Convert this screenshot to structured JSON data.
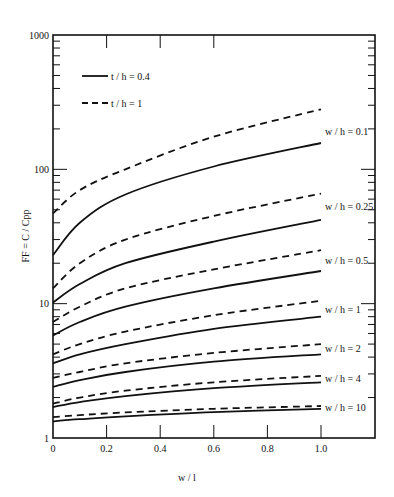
{
  "chart_data": {
    "type": "line",
    "title": "",
    "xlabel": "w / l",
    "ylabel": "FF = C / Cpp",
    "xlim": [
      0,
      1.2
    ],
    "ylim": [
      1,
      1000
    ],
    "yscale": "log",
    "grid": false,
    "x_ticks": [
      0,
      0.2,
      0.4,
      0.6,
      0.8,
      1.0
    ],
    "x_tick_labels": [
      "0",
      "0.2",
      "0.4",
      "0.6",
      "0.8",
      "1.0"
    ],
    "y_ticks": [
      1,
      10,
      100,
      1000
    ],
    "y_tick_labels": [
      "1",
      "10",
      "100",
      "1000"
    ],
    "legend": {
      "position": "upper-left",
      "entries": [
        {
          "label": "t / h = 0.4",
          "style": "solid"
        },
        {
          "label": "t / h = 1",
          "style": "dashed"
        }
      ]
    },
    "x": [
      0,
      0.1,
      0.27,
      0.6,
      1.0
    ],
    "series": [
      {
        "name": "w/h=0.1, t/h=0.4",
        "group": "w / h = 0.1",
        "style": "solid",
        "values": [
          23,
          40,
          65,
          105,
          157
        ]
      },
      {
        "name": "w/h=0.1, t/h=1",
        "group": "w / h = 0.1",
        "style": "dashed",
        "values": [
          47,
          70,
          100,
          175,
          280
        ]
      },
      {
        "name": "w/h=0.25, t/h=0.4",
        "group": "w / h = 0.25",
        "style": "solid",
        "values": [
          10.2,
          14,
          20,
          29,
          42
        ]
      },
      {
        "name": "w/h=0.25, t/h=1",
        "group": "w / h = 0.25",
        "style": "dashed",
        "values": [
          13,
          20,
          30,
          45,
          66
        ]
      },
      {
        "name": "w/h=0.5, t/h=0.4",
        "group": "w / h = 0.5",
        "style": "solid",
        "values": [
          5.8,
          7.3,
          9.5,
          13,
          17.5
        ]
      },
      {
        "name": "w/h=0.5, t/h=1",
        "group": "w / h = 0.5",
        "style": "dashed",
        "values": [
          7.3,
          9.5,
          13,
          18,
          25
        ]
      },
      {
        "name": "w/h=1, t/h=0.4",
        "group": "w / h = 1",
        "style": "solid",
        "values": [
          3.6,
          4.2,
          5.0,
          6.5,
          8.0
        ]
      },
      {
        "name": "w/h=1, t/h=1",
        "group": "w / h = 1",
        "style": "dashed",
        "values": [
          4.2,
          5.0,
          6.2,
          8.2,
          10.5
        ]
      },
      {
        "name": "w/h=2, t/h=0.4",
        "group": "w / h = 2",
        "style": "solid",
        "values": [
          2.4,
          2.7,
          3.1,
          3.7,
          4.2
        ]
      },
      {
        "name": "w/h=2, t/h=1",
        "group": "w / h = 2",
        "style": "dashed",
        "values": [
          2.8,
          3.1,
          3.6,
          4.3,
          5.0
        ]
      },
      {
        "name": "w/h=4, t/h=0.4",
        "group": "w / h = 4",
        "style": "solid",
        "values": [
          1.7,
          1.85,
          2.05,
          2.35,
          2.6
        ]
      },
      {
        "name": "w/h=4, t/h=1",
        "group": "w / h = 4",
        "style": "dashed",
        "values": [
          1.8,
          2.0,
          2.25,
          2.6,
          2.9
        ]
      },
      {
        "name": "w/h=10, t/h=0.4",
        "group": "w / h = 10",
        "style": "solid",
        "values": [
          1.33,
          1.38,
          1.45,
          1.56,
          1.65
        ]
      },
      {
        "name": "w/h=10, t/h=1",
        "group": "w / h = 10",
        "style": "dashed",
        "values": [
          1.43,
          1.48,
          1.55,
          1.65,
          1.73
        ]
      }
    ],
    "curve_labels": [
      {
        "text": "w / h = 0.1",
        "y_value": 190
      },
      {
        "text": "w / h = 0.25",
        "y_value": 53
      },
      {
        "text": "w / h = 0.5",
        "y_value": 21
      },
      {
        "text": "w / h = 1",
        "y_value": 9.1
      },
      {
        "text": "w / h = 2",
        "y_value": 4.6
      },
      {
        "text": "w / h = 4",
        "y_value": 2.75
      },
      {
        "text": "w / h = 10",
        "y_value": 1.69
      }
    ]
  }
}
